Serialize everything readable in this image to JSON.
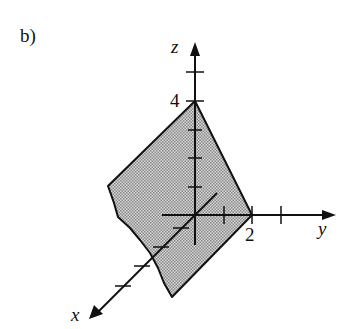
{
  "figure": {
    "part_label": "b)",
    "axes": {
      "x": {
        "name": "x"
      },
      "y": {
        "name": "y",
        "marked_value": "2"
      },
      "z": {
        "name": "z",
        "marked_value": "4"
      }
    },
    "region": {
      "description": "Shaded plane region bounded by z-intercept 4 and y-intercept 2, extending toward positive x with a rough (cut-off) edge",
      "fill_color": "#b8b8b8",
      "edge_color": "#111111"
    }
  }
}
